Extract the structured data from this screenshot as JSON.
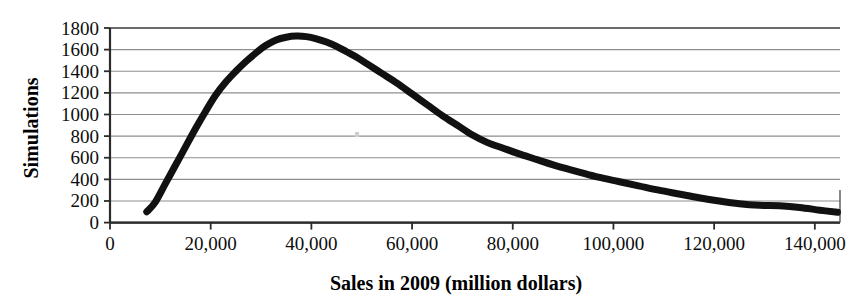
{
  "chart_data": {
    "type": "line",
    "title": "",
    "xlabel": "Sales in 2009 (million dollars)",
    "ylabel": "Simulations",
    "xlim": [
      0,
      145000
    ],
    "ylim": [
      0,
      1800
    ],
    "xticks": [
      0,
      20000,
      40000,
      60000,
      80000,
      100000,
      120000,
      140000
    ],
    "xtick_labels": [
      "0",
      "20,000",
      "40,000",
      "60,000",
      "80,000",
      "100,000",
      "120,000",
      "140,000"
    ],
    "yticks": [
      0,
      200,
      400,
      600,
      800,
      1000,
      1200,
      1400,
      1600,
      1800
    ],
    "ytick_labels": [
      "0",
      "200",
      "400",
      "600",
      "800",
      "1000",
      "1200",
      "1400",
      "1600",
      "1800"
    ],
    "grid": "horizontal",
    "legend": "none",
    "series": [
      {
        "name": "Simulated sales distribution",
        "color": "#111111",
        "line_width": 7,
        "x": [
          7300,
          9000,
          11000,
          13000,
          15000,
          17000,
          19000,
          21000,
          23000,
          25000,
          27000,
          29000,
          31000,
          33000,
          35000,
          37000,
          39000,
          41000,
          43000,
          45000,
          47000,
          49000,
          51000,
          54000,
          57000,
          60000,
          63000,
          66000,
          69000,
          72000,
          75000,
          78000,
          81000,
          85000,
          89000,
          93000,
          97000,
          101000,
          105000,
          109000,
          113000,
          117000,
          121000,
          125000,
          129000,
          133000,
          137000,
          141000,
          144500
        ],
        "y": [
          100,
          190,
          360,
          530,
          700,
          870,
          1030,
          1180,
          1300,
          1400,
          1490,
          1570,
          1640,
          1690,
          1715,
          1725,
          1720,
          1700,
          1670,
          1630,
          1580,
          1530,
          1470,
          1380,
          1290,
          1190,
          1090,
          990,
          900,
          810,
          740,
          690,
          640,
          580,
          520,
          470,
          420,
          380,
          340,
          300,
          265,
          230,
          200,
          175,
          160,
          155,
          140,
          115,
          95
        ]
      }
    ]
  },
  "artifacts": [
    {
      "name": "scan-speck",
      "x": 355,
      "y": 132
    }
  ]
}
